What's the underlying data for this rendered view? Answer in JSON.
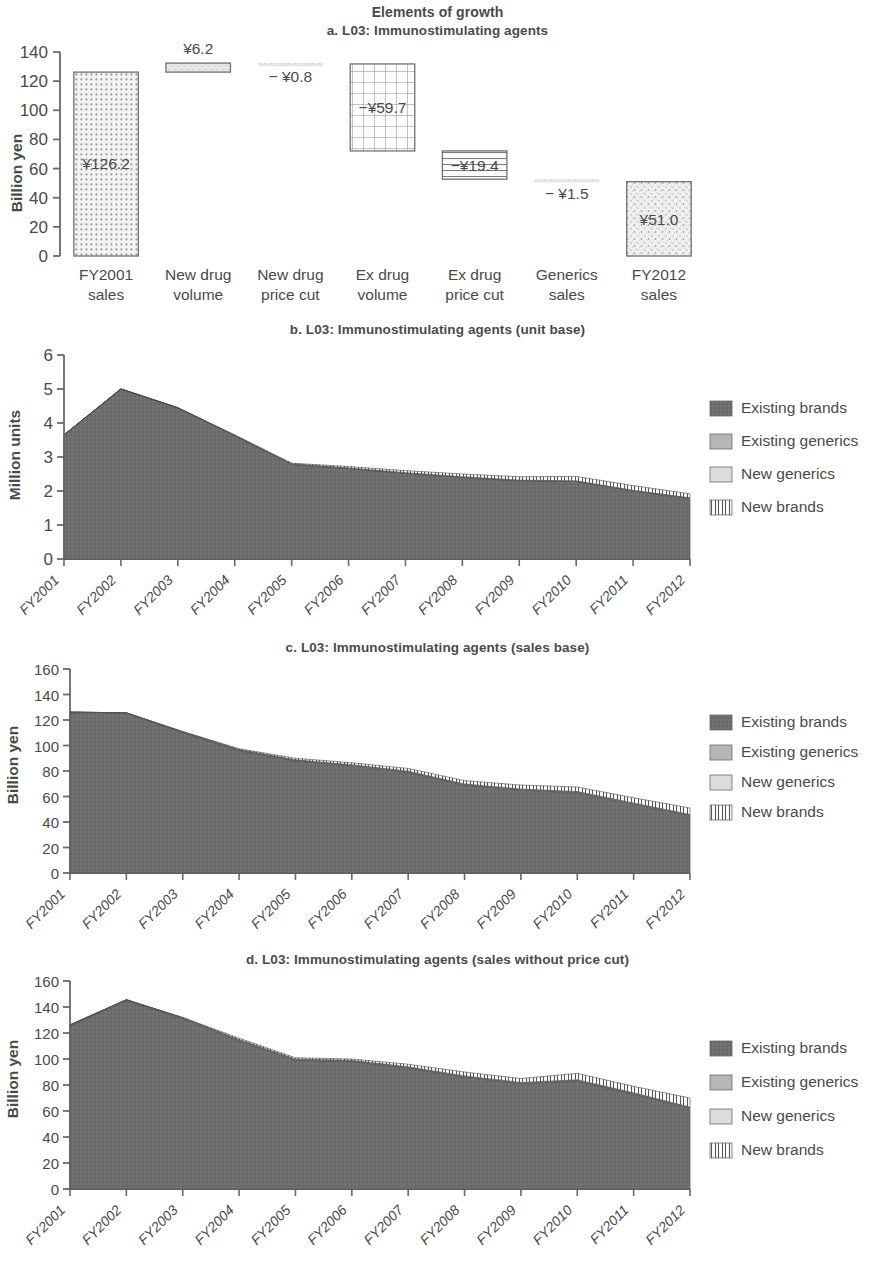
{
  "figure": {
    "supertitle": "Elements of growth"
  },
  "colors": {
    "existing_brands": "#6e6e6e",
    "existing_generics": "#b6b6b6",
    "new_generics": "#dcdcdc",
    "new_brands": "#ffffff",
    "axis": "#6a6a6a",
    "text": "#4a4a4a"
  },
  "legend": {
    "items": [
      {
        "label": "Existing brands",
        "swatch": "existing-brands-swatch"
      },
      {
        "label": "Existing generics",
        "swatch": "existing-generics-swatch"
      },
      {
        "label": "New generics",
        "swatch": "new-generics-swatch"
      },
      {
        "label": "New brands",
        "swatch": "new-brands-swatch"
      }
    ]
  },
  "panel_a": {
    "title": "a. L03: Immunostimulating agents",
    "chart_data": {
      "type": "bar",
      "subtype": "waterfall",
      "title": "a. L03: Immunostimulating agents",
      "xlabel": "",
      "ylabel": "Billion yen",
      "ylim": [
        0,
        140
      ],
      "yticks": [
        0,
        20,
        40,
        60,
        80,
        100,
        120,
        140
      ],
      "grid": false,
      "categories": [
        "FY2001 sales",
        "New drug volume",
        "New drug price cut",
        "Ex drug volume",
        "Ex drug price cut",
        "Generics sales",
        "FY2012 sales"
      ],
      "category_lines": [
        [
          "FY2001",
          "sales"
        ],
        [
          "New drug",
          "volume"
        ],
        [
          "New drug",
          "price cut"
        ],
        [
          "Ex drug",
          "volume"
        ],
        [
          "Ex drug",
          "price cut"
        ],
        [
          "Generics",
          "sales"
        ],
        [
          "FY2012",
          "sales"
        ]
      ],
      "deltas": [
        126.2,
        6.2,
        -0.8,
        -59.7,
        -19.4,
        -1.5,
        51.0
      ],
      "kinds": [
        "total",
        "delta",
        "delta",
        "delta",
        "delta",
        "delta",
        "total"
      ],
      "bar_bottoms": [
        0.0,
        126.2,
        131.6,
        72.1,
        52.7,
        51.2,
        0.0
      ],
      "bar_tops": [
        126.2,
        132.4,
        132.4,
        131.8,
        72.1,
        52.7,
        51.0
      ],
      "data_labels": [
        "¥126.2",
        "¥6.2",
        "− ¥0.8",
        "−¥59.7",
        "−¥19.4",
        "− ¥1.5",
        "¥51.0"
      ],
      "fills": [
        "dots",
        "light",
        "light",
        "grid",
        "hlines",
        "light",
        "speckle"
      ]
    }
  },
  "panel_b": {
    "title": "b. L03: Immunostimulating agents (unit base)",
    "chart_data": {
      "type": "area",
      "stacked": true,
      "title": "b. L03: Immunostimulating agents (unit base)",
      "xlabel": "",
      "ylabel": "Million units",
      "ylim": [
        0,
        6
      ],
      "yticks": [
        0,
        1,
        2,
        3,
        4,
        5,
        6
      ],
      "grid": false,
      "legend_position": "right",
      "categories": [
        "FY2001",
        "FY2002",
        "FY2003",
        "FY2004",
        "FY2005",
        "FY2006",
        "FY2007",
        "FY2008",
        "FY2009",
        "FY2010",
        "FY2011",
        "FY2012"
      ],
      "series": [
        {
          "name": "Existing brands",
          "values": [
            3.65,
            5.0,
            4.44,
            3.62,
            2.78,
            2.66,
            2.52,
            2.4,
            2.3,
            2.28,
            2.0,
            1.78
          ]
        },
        {
          "name": "Existing generics",
          "values": [
            0.0,
            0.0,
            0.01,
            0.01,
            0.01,
            0.01,
            0.01,
            0.01,
            0.01,
            0.01,
            0.01,
            0.01
          ]
        },
        {
          "name": "New generics",
          "values": [
            0.0,
            0.0,
            0.0,
            0.01,
            0.01,
            0.01,
            0.01,
            0.01,
            0.01,
            0.01,
            0.01,
            0.01
          ]
        },
        {
          "name": "New brands",
          "values": [
            0.0,
            0.0,
            0.0,
            0.01,
            0.02,
            0.04,
            0.06,
            0.08,
            0.1,
            0.13,
            0.14,
            0.12
          ]
        }
      ],
      "totals": [
        3.65,
        5.0,
        4.45,
        3.65,
        2.82,
        2.72,
        2.6,
        2.5,
        2.42,
        2.43,
        2.16,
        1.92
      ]
    }
  },
  "panel_c": {
    "title": "c. L03: Immunostimulating agents (sales base)",
    "chart_data": {
      "type": "area",
      "stacked": true,
      "title": "c. L03: Immunostimulating agents (sales base)",
      "xlabel": "",
      "ylabel": "Billion yen",
      "ylim": [
        0,
        160
      ],
      "yticks": [
        0,
        20,
        40,
        60,
        80,
        100,
        120,
        140,
        160
      ],
      "grid": false,
      "legend_position": "right",
      "categories": [
        "FY2001",
        "FY2002",
        "FY2003",
        "FY2004",
        "FY2005",
        "FY2006",
        "FY2007",
        "FY2008",
        "FY2009",
        "FY2010",
        "FY2011",
        "FY2012"
      ],
      "series": [
        {
          "name": "Existing brands",
          "values": [
            125.5,
            125.0,
            110.0,
            96.0,
            88.0,
            84.0,
            79.0,
            69.0,
            65.0,
            63.0,
            54.0,
            45.0
          ]
        },
        {
          "name": "Existing generics",
          "values": [
            0.7,
            0.6,
            0.5,
            0.5,
            0.4,
            0.4,
            0.4,
            0.4,
            0.4,
            0.4,
            0.4,
            0.4
          ]
        },
        {
          "name": "New generics",
          "values": [
            0.0,
            0.0,
            0.3,
            0.4,
            0.4,
            0.5,
            0.5,
            0.5,
            0.5,
            0.5,
            0.5,
            0.5
          ]
        },
        {
          "name": "New brands",
          "values": [
            0.0,
            0.0,
            0.2,
            0.6,
            1.2,
            1.6,
            2.1,
            2.6,
            3.1,
            3.6,
            4.1,
            5.1
          ]
        }
      ],
      "totals": [
        126.2,
        125.6,
        111.0,
        97.5,
        90.0,
        86.5,
        82.0,
        72.5,
        69.0,
        67.5,
        59.0,
        51.0
      ]
    }
  },
  "panel_d": {
    "title": "d. L03: Immunostimulating agents  (sales without price cut)",
    "chart_data": {
      "type": "area",
      "stacked": true,
      "title": "d. L03: Immunostimulating agents  (sales without price cut)",
      "xlabel": "",
      "ylabel": "Billion yen",
      "ylim": [
        0,
        160
      ],
      "yticks": [
        0,
        20,
        40,
        60,
        80,
        100,
        120,
        140,
        160
      ],
      "grid": false,
      "legend_position": "right",
      "categories": [
        "FY2001",
        "FY2002",
        "FY2003",
        "FY2004",
        "FY2005",
        "FY2006",
        "FY2007",
        "FY2008",
        "FY2009",
        "FY2010",
        "FY2011",
        "FY2012"
      ],
      "series": [
        {
          "name": "Existing brands",
          "values": [
            125.5,
            145.0,
            131.0,
            114.0,
            99.0,
            98.0,
            93.0,
            86.0,
            81.0,
            83.0,
            73.0,
            62.0
          ]
        },
        {
          "name": "Existing generics",
          "values": [
            0.7,
            0.6,
            0.5,
            0.5,
            0.5,
            0.5,
            0.5,
            0.5,
            0.5,
            0.5,
            0.5,
            0.5
          ]
        },
        {
          "name": "New generics",
          "values": [
            0.0,
            0.0,
            0.3,
            0.5,
            0.5,
            0.5,
            0.5,
            0.5,
            0.5,
            0.5,
            0.5,
            0.5
          ]
        },
        {
          "name": "New brands",
          "values": [
            0.0,
            0.0,
            0.2,
            1.0,
            1.0,
            1.0,
            2.0,
            3.0,
            3.0,
            5.0,
            5.0,
            7.0
          ]
        }
      ],
      "totals": [
        126.2,
        145.6,
        132.0,
        116.0,
        101.0,
        100.0,
        96.0,
        90.0,
        85.0,
        89.0,
        79.0,
        70.0
      ]
    }
  }
}
